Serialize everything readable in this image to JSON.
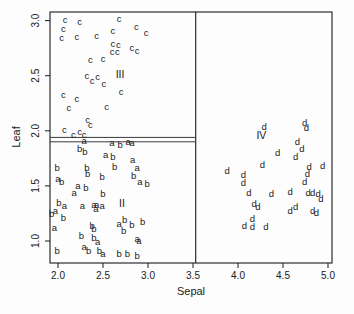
{
  "figure": {
    "background": "#fdfdfd",
    "ink": "#1a1a1a"
  },
  "chart_data": {
    "type": "scatter",
    "title": "",
    "xlabel": "Sepal",
    "ylabel": "Leaf",
    "marker_style": "letters-as-points",
    "x_ticks": [
      "2.0",
      "2.5",
      "3.0",
      "3.5",
      "4.0",
      "4.5",
      "5.0"
    ],
    "y_ticks": [
      "1.0",
      "1.5",
      "2.0",
      "2.5",
      "3.0"
    ],
    "xlim": [
      1.91,
      5.04
    ],
    "ylim": [
      0.8,
      3.08
    ],
    "grid": false,
    "legend": "none",
    "series": [
      {
        "name": "group-a",
        "marker": "a",
        "points": [
          [
            2.29,
            1.91
          ],
          [
            2.6,
            1.89
          ],
          [
            2.78,
            1.9
          ],
          [
            2.82,
            1.89
          ],
          [
            2.53,
            1.78
          ],
          [
            2.83,
            1.74
          ],
          [
            2.88,
            1.66
          ],
          [
            2.0,
            1.56
          ],
          [
            2.91,
            1.54
          ],
          [
            2.22,
            1.5
          ],
          [
            2.18,
            1.44
          ],
          [
            2.07,
            1.32
          ],
          [
            2.27,
            1.32
          ],
          [
            2.4,
            1.33
          ],
          [
            2.43,
            1.33
          ],
          [
            2.49,
            1.32
          ],
          [
            2.42,
            1.29
          ],
          [
            1.97,
            1.27
          ],
          [
            2.68,
            1.16
          ],
          [
            1.96,
            1.12
          ],
          [
            2.44,
            0.99
          ],
          [
            2.29,
            0.95
          ],
          [
            2.5,
            0.88
          ],
          [
            2.88,
            1.02
          ],
          [
            2.9,
            1.0
          ]
        ]
      },
      {
        "name": "group-b",
        "marker": "b",
        "points": [
          [
            1.99,
            1.66
          ],
          [
            2.32,
            1.66
          ],
          [
            2.63,
            1.67
          ],
          [
            2.33,
            1.61
          ],
          [
            2.49,
            1.58
          ],
          [
            2.84,
            1.59
          ],
          [
            2.99,
            1.52
          ],
          [
            2.04,
            1.54
          ],
          [
            2.31,
            1.48
          ],
          [
            2.5,
            1.43
          ],
          [
            2.01,
            1.35
          ],
          [
            1.93,
            1.25
          ],
          [
            2.06,
            1.21
          ],
          [
            2.74,
            1.19
          ],
          [
            2.82,
            1.15
          ],
          [
            2.94,
            1.17
          ],
          [
            2.38,
            1.14
          ],
          [
            2.4,
            1.11
          ],
          [
            2.73,
            1.09
          ],
          [
            2.26,
            1.05
          ],
          [
            2.4,
            1.03
          ],
          [
            1.99,
            0.91
          ],
          [
            2.34,
            0.91
          ],
          [
            2.46,
            0.91
          ],
          [
            2.68,
            0.88
          ],
          [
            2.77,
            0.88
          ],
          [
            2.88,
            0.87
          ],
          [
            2.24,
            1.84
          ],
          [
            2.3,
            1.81
          ],
          [
            2.61,
            1.76
          ],
          [
            2.69,
            1.87
          ]
        ]
      },
      {
        "name": "group-c",
        "marker": "c",
        "points": [
          [
            2.08,
            3.01
          ],
          [
            2.24,
            2.99
          ],
          [
            2.68,
            3.02
          ],
          [
            2.06,
            2.93
          ],
          [
            2.61,
            2.91
          ],
          [
            2.87,
            2.94
          ],
          [
            2.98,
            2.89
          ],
          [
            2.04,
            2.84
          ],
          [
            2.21,
            2.85
          ],
          [
            2.43,
            2.86
          ],
          [
            2.61,
            2.79
          ],
          [
            2.67,
            2.78
          ],
          [
            2.82,
            2.75
          ],
          [
            2.88,
            2.73
          ],
          [
            2.6,
            2.72
          ],
          [
            2.66,
            2.72
          ],
          [
            2.36,
            2.64
          ],
          [
            2.5,
            2.65
          ],
          [
            2.32,
            2.5
          ],
          [
            2.44,
            2.49
          ],
          [
            2.38,
            2.45
          ],
          [
            2.51,
            2.43
          ],
          [
            2.7,
            2.35
          ],
          [
            2.06,
            2.33
          ],
          [
            2.21,
            2.29
          ],
          [
            2.12,
            2.21
          ],
          [
            2.54,
            2.22
          ],
          [
            2.33,
            2.1
          ],
          [
            2.36,
            2.05
          ],
          [
            2.07,
            2.01
          ],
          [
            2.17,
            1.96
          ],
          [
            2.24,
            1.99
          ],
          [
            2.29,
            1.96
          ]
        ]
      },
      {
        "name": "group-d",
        "marker": "d",
        "points": [
          [
            4.29,
            2.04
          ],
          [
            4.74,
            2.07
          ],
          [
            4.76,
            2.03
          ],
          [
            4.66,
            1.9
          ],
          [
            4.71,
            1.84
          ],
          [
            4.44,
            1.8
          ],
          [
            4.64,
            1.76
          ],
          [
            4.27,
            1.69
          ],
          [
            4.79,
            1.67
          ],
          [
            4.94,
            1.68
          ],
          [
            3.88,
            1.64
          ],
          [
            4.06,
            1.6
          ],
          [
            4.06,
            1.53
          ],
          [
            4.77,
            1.61
          ],
          [
            4.74,
            1.54
          ],
          [
            4.12,
            1.44
          ],
          [
            4.37,
            1.43
          ],
          [
            4.58,
            1.45
          ],
          [
            4.78,
            1.44
          ],
          [
            4.83,
            1.44
          ],
          [
            4.89,
            1.43
          ],
          [
            4.92,
            1.38
          ],
          [
            4.18,
            1.34
          ],
          [
            4.22,
            1.31
          ],
          [
            4.64,
            1.31
          ],
          [
            4.58,
            1.27
          ],
          [
            4.83,
            1.27
          ],
          [
            4.87,
            1.26
          ],
          [
            4.16,
            1.2
          ],
          [
            4.07,
            1.14
          ],
          [
            4.16,
            1.13
          ],
          [
            4.31,
            1.13
          ]
        ]
      }
    ],
    "annotations": [
      {
        "text": "II",
        "x": 2.71,
        "y": 1.34
      },
      {
        "text": "III",
        "x": 2.69,
        "y": 2.51
      },
      {
        "text": "IV",
        "x": 4.26,
        "y": 1.96
      }
    ],
    "reference_lines": {
      "vertical": [
        {
          "x": 3.53,
          "from_y": "top",
          "to_y": "bottom"
        }
      ],
      "horizontal": [
        {
          "y": 1.94,
          "from_x": "left",
          "to_x": 3.53
        },
        {
          "y": 1.9,
          "from_x": "left",
          "to_x": 3.53
        }
      ]
    }
  }
}
